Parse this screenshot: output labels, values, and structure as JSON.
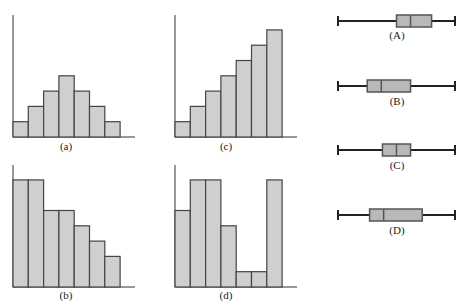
{
  "chart_data": [
    {
      "type": "bar",
      "id": "a",
      "label": "(a)",
      "categories": [
        "1",
        "2",
        "3",
        "4",
        "5",
        "6",
        "7"
      ],
      "values": [
        1,
        2,
        3,
        4,
        3,
        2,
        1
      ],
      "shape": "symmetric mound"
    },
    {
      "type": "bar",
      "id": "b",
      "label": "(b)",
      "categories": [
        "1",
        "2",
        "3",
        "4",
        "5",
        "6",
        "7"
      ],
      "values": [
        7,
        7,
        5,
        5,
        4,
        3,
        2
      ],
      "shape": "skewed right (decreasing)"
    },
    {
      "type": "bar",
      "id": "c",
      "label": "(c)",
      "categories": [
        "1",
        "2",
        "3",
        "4",
        "5",
        "6",
        "7"
      ],
      "values": [
        1,
        2,
        3,
        4,
        5,
        6,
        7
      ],
      "shape": "skewed left (increasing)"
    },
    {
      "type": "bar",
      "id": "d",
      "label": "(d)",
      "categories": [
        "1",
        "2",
        "3",
        "4",
        "5",
        "6",
        "7"
      ],
      "values": [
        5,
        7,
        7,
        4,
        1,
        1,
        7
      ],
      "shape": "irregular / bimodal"
    },
    {
      "type": "boxplot",
      "id": "A",
      "label": "(A)",
      "min": 0,
      "q1": 50,
      "median": 62,
      "q3": 80,
      "max": 100
    },
    {
      "type": "boxplot",
      "id": "B",
      "label": "(B)",
      "min": 0,
      "q1": 25,
      "median": 37,
      "q3": 62,
      "max": 100
    },
    {
      "type": "boxplot",
      "id": "C",
      "label": "(C)",
      "min": 0,
      "q1": 38,
      "median": 50,
      "q3": 62,
      "max": 100
    },
    {
      "type": "boxplot",
      "id": "D",
      "label": "(D)",
      "min": 0,
      "q1": 27,
      "median": 39,
      "q3": 72,
      "max": 100
    }
  ],
  "labels": {
    "a": "(a)",
    "b": "(b)",
    "c": "(c)",
    "d": "(d)",
    "A": "(A)",
    "B": "(B)",
    "C": "(C)",
    "D": "(D)"
  },
  "colors": {
    "bar_fill": "#cfcfcf",
    "bar_stroke": "#444444",
    "box_fill": "#b9b9b9",
    "axis": "#333333"
  }
}
